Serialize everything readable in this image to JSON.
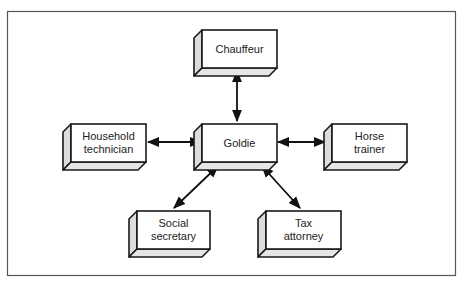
{
  "diagram": {
    "type": "hub-and-spoke",
    "hub": {
      "id": "goldie",
      "label_lines": [
        "Goldie"
      ]
    },
    "nodes": [
      {
        "id": "chauffeur",
        "label_lines": [
          "Chauffeur"
        ]
      },
      {
        "id": "household-technician",
        "label_lines": [
          "Household",
          "technician"
        ]
      },
      {
        "id": "horse-trainer",
        "label_lines": [
          "Horse",
          "trainer"
        ]
      },
      {
        "id": "social-secretary",
        "label_lines": [
          "Social",
          "secretary"
        ]
      },
      {
        "id": "tax-attorney",
        "label_lines": [
          "Tax",
          "attorney"
        ]
      }
    ],
    "edges": [
      {
        "from": "goldie",
        "to": "chauffeur",
        "direction": "bidirectional"
      },
      {
        "from": "goldie",
        "to": "household-technician",
        "direction": "bidirectional"
      },
      {
        "from": "goldie",
        "to": "horse-trainer",
        "direction": "bidirectional"
      },
      {
        "from": "goldie",
        "to": "social-secretary",
        "direction": "bidirectional"
      },
      {
        "from": "goldie",
        "to": "tax-attorney",
        "direction": "bidirectional"
      }
    ]
  },
  "labels": {
    "chauffeur": "Chauffeur",
    "goldie": "Goldie",
    "household_1": "Household",
    "household_2": "technician",
    "horse_1": "Horse",
    "horse_2": "trainer",
    "social_1": "Social",
    "social_2": "secretary",
    "tax_1": "Tax",
    "tax_2": "attorney"
  },
  "colors": {
    "box_face": "#ffffff",
    "box_side": "#dcdcdc",
    "line": "#111111",
    "frame": "#555555"
  }
}
